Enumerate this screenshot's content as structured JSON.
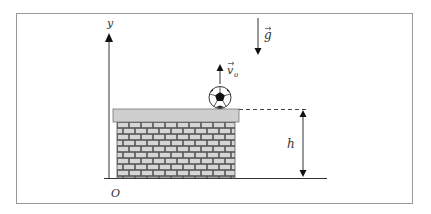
{
  "diagram": {
    "type": "physics-projectile",
    "labels": {
      "y_axis": "y",
      "origin": "O",
      "gravity": "g",
      "initial_velocity": "v",
      "initial_velocity_subscript": "o",
      "height": "h"
    },
    "elements": [
      "y-axis arrow",
      "ground line",
      "brick wall with gray top slab",
      "soccer ball on top of wall",
      "upward initial velocity arrow",
      "downward gravity arrow",
      "dashed reference line at wall top",
      "double-headed height arrow"
    ],
    "colors": {
      "frame": "#9a9a9a",
      "line": "#222222",
      "brick_fill": "#d6d6d6",
      "mortar": "#555555",
      "cap_fill": "#cfcfcf"
    }
  }
}
